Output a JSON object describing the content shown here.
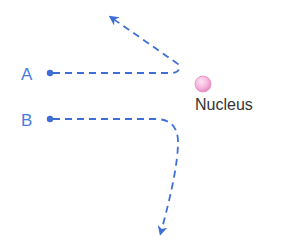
{
  "diagram": {
    "type": "particle-scattering-trajectories",
    "colors": {
      "path": "#3f6fd6",
      "label": "#4a7be0",
      "nucleus_fill": "#f4a7d6",
      "nucleus_highlight": "#fde3f3",
      "nucleus_stroke": "#e58cc2",
      "nucleus_label": "#333333"
    },
    "paths": [
      {
        "label": "A",
        "start": [
          50,
          73
        ],
        "deflection": "backward-upward"
      },
      {
        "label": "B",
        "start": [
          50,
          119
        ],
        "deflection": "downward"
      }
    ],
    "nucleus": {
      "label": "Nucleus",
      "center": [
        203,
        84
      ],
      "radius": 8
    }
  }
}
